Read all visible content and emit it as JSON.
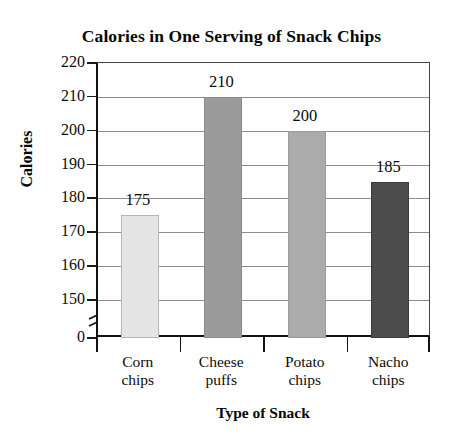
{
  "chart_data": {
    "type": "bar",
    "title": "Calories in One Serving of Snack Chips",
    "xlabel": "Type of Snack",
    "ylabel": "Calories",
    "categories": [
      "Corn chips",
      "Cheese puffs",
      "Potato chips",
      "Nacho chips"
    ],
    "category_lines": [
      [
        "Corn",
        "chips"
      ],
      [
        "Cheese",
        "puffs"
      ],
      [
        "Potato",
        "chips"
      ],
      [
        "Nacho",
        "chips"
      ]
    ],
    "values": [
      175,
      210,
      200,
      185
    ],
    "value_labels": [
      "175",
      "210",
      "200",
      "185"
    ],
    "ylim": [
      150,
      220
    ],
    "y_axis_broken": true,
    "y_break_between": [
      0,
      150
    ],
    "yticks": [
      "220",
      "210",
      "200",
      "190",
      "180",
      "170",
      "160",
      "150",
      "0"
    ],
    "ytick_values": [
      220,
      210,
      200,
      190,
      180,
      170,
      160,
      150,
      0
    ],
    "grid": true,
    "grid_axis": "y",
    "legend": "none",
    "bar_colors": [
      "#e4e4e4",
      "#9b9b9b",
      "#ababab",
      "#4c4c4c"
    ],
    "bar_edge_colors": [
      "#b8b8b8",
      "#8a8a8a",
      "#9a9a9a",
      "#3a3a3a"
    ],
    "axis_color": "#111111",
    "gridline_color": "#8d8d8d",
    "background": "#ffffff"
  }
}
